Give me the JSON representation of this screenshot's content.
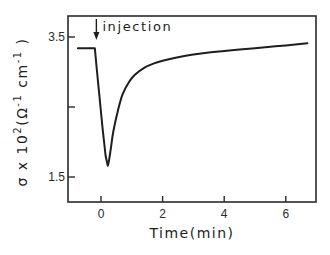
{
  "chart_data": {
    "type": "line",
    "title": "",
    "xlabel": "Time(min)",
    "ylabel": "σ x 10²(Ω⁻¹ cm⁻¹)",
    "ylabel_parts": {
      "sym": "σ x 10",
      "exp1": "2",
      "mid": "(Ω",
      "exp2": "-1",
      "end": " cm",
      "exp3": "-1",
      "close": " )"
    },
    "xlim": [
      -1.1,
      7.0
    ],
    "ylim": [
      1.15,
      3.8
    ],
    "xticks": [
      0,
      2,
      4,
      6
    ],
    "xtick_labels": [
      "0",
      "2",
      "4",
      "6"
    ],
    "yticks": [
      1.5,
      2.5,
      3.5
    ],
    "ytick_labels": [
      "1.5",
      "",
      "3.5"
    ],
    "grid": false,
    "legend": null,
    "annotations": [
      {
        "text": "injection",
        "x": -0.15,
        "arrow": "down"
      }
    ],
    "series": [
      {
        "name": "conductivity",
        "x": [
          -0.75,
          -0.2,
          -0.15,
          -0.05,
          0.05,
          0.15,
          0.22,
          0.3,
          0.4,
          0.55,
          0.7,
          0.9,
          1.1,
          1.4,
          1.7,
          2.0,
          2.5,
          3.0,
          3.5,
          4.0,
          4.5,
          5.0,
          5.5,
          6.0,
          6.7
        ],
        "y": [
          3.34,
          3.34,
          3.1,
          2.65,
          2.2,
          1.8,
          1.66,
          1.85,
          2.15,
          2.45,
          2.68,
          2.85,
          2.96,
          3.06,
          3.12,
          3.16,
          3.21,
          3.25,
          3.28,
          3.3,
          3.32,
          3.34,
          3.36,
          3.38,
          3.41
        ]
      }
    ]
  }
}
